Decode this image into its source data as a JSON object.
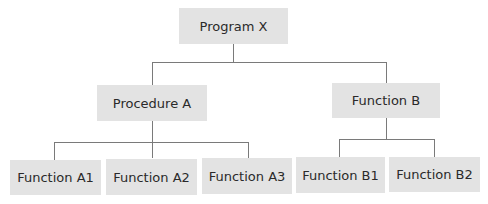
{
  "diagram": {
    "type": "hierarchy-chart",
    "colors": {
      "box_fill": "#e3e3e3",
      "connector": "#7a7a7a",
      "text": "#2a2a2a"
    },
    "root": {
      "label": "Program X"
    },
    "level1": [
      {
        "label": "Procedure A"
      },
      {
        "label": "Function B"
      }
    ],
    "level2": [
      {
        "label": "Function A1",
        "parent": "Procedure A"
      },
      {
        "label": "Function A2",
        "parent": "Procedure A"
      },
      {
        "label": "Function A3",
        "parent": "Procedure A"
      },
      {
        "label": "Function B1",
        "parent": "Function B"
      },
      {
        "label": "Function B2",
        "parent": "Function B"
      }
    ]
  }
}
